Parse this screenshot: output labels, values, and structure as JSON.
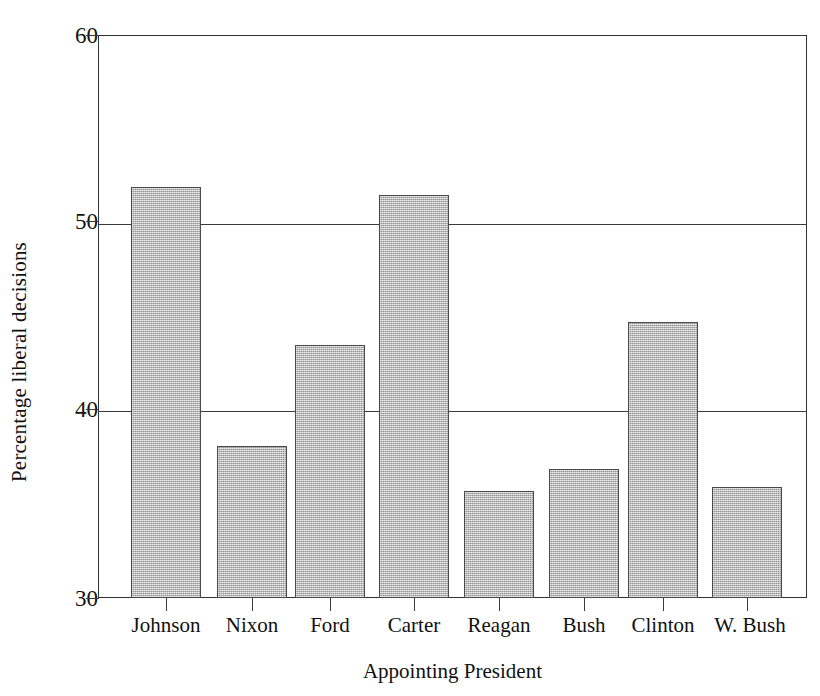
{
  "chart_data": {
    "type": "bar",
    "title": "",
    "xlabel": "Appointing President",
    "ylabel": "Percentage liberal decisions",
    "categories": [
      "Johnson",
      "Nixon",
      "Ford",
      "Carter",
      "Reagan",
      "Bush",
      "Clinton",
      "W. Bush"
    ],
    "values": [
      51.9,
      38.1,
      43.5,
      51.5,
      35.7,
      36.9,
      44.7,
      35.9
    ],
    "ylim": [
      30,
      60
    ],
    "yticks": [
      30,
      40,
      50,
      60
    ],
    "ytick_labels": [
      "30",
      "40",
      "50",
      "60"
    ],
    "grid": "horizontal-at-yticks",
    "legend": "none",
    "bar_fill_color": "#b3b3b3",
    "bar_edge_color": "#4a4a4a",
    "axis_color": "#333333",
    "background_color": "#ffffff"
  },
  "axes": {
    "y_title": "Percentage liberal decisions",
    "x_title": "Appointing President"
  }
}
